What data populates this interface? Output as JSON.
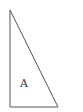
{
  "diagram": {
    "shape": "right-triangle",
    "vertices": {
      "apex": [
        10,
        10
      ],
      "bottom_left": [
        10,
        107
      ],
      "bottom_right": [
        58,
        107
      ]
    },
    "stroke_color": "#555555",
    "fill_color": "#ffffff",
    "label": {
      "text": "A",
      "x": 20,
      "y": 87
    }
  }
}
